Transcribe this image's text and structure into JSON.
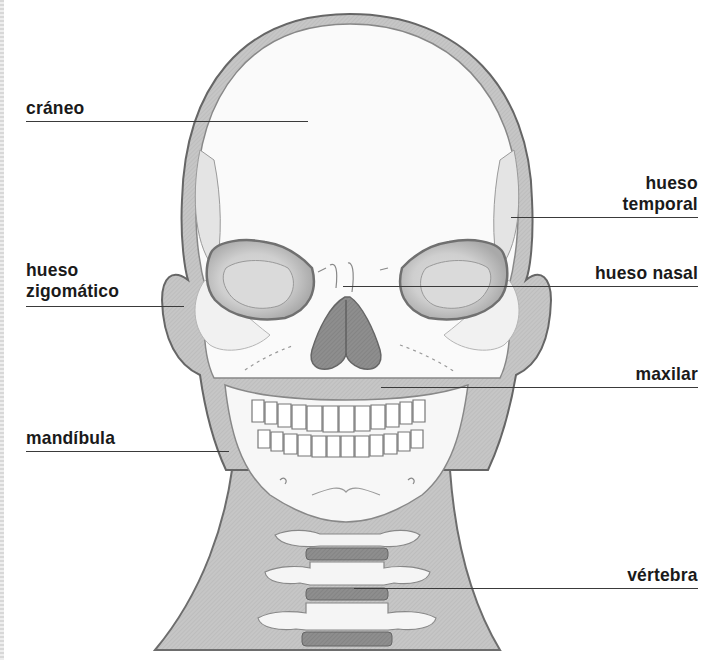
{
  "diagram": {
    "title": "",
    "colors": {
      "background": "#ffffff",
      "bone": "#f4f4f4",
      "tissue": "#c9c9c9",
      "outline": "#6a6a6a",
      "dark_disc": "#6f6f6f",
      "label_text": "#1a1a1a",
      "leader_line": "#3a3a3a"
    },
    "labels": [
      {
        "id": "craneo",
        "lines": [
          "cráneo"
        ],
        "side": "left"
      },
      {
        "id": "hueso-zigomatico",
        "lines": [
          "hueso",
          "zigomático"
        ],
        "side": "left"
      },
      {
        "id": "mandibula",
        "lines": [
          "mandíbula"
        ],
        "side": "left"
      },
      {
        "id": "hueso-temporal",
        "lines": [
          "hueso",
          "temporal"
        ],
        "side": "right"
      },
      {
        "id": "hueso-nasal",
        "lines": [
          "hueso nasal"
        ],
        "side": "right"
      },
      {
        "id": "maxilar",
        "lines": [
          "maxilar"
        ],
        "side": "right"
      },
      {
        "id": "vertebra",
        "lines": [
          "vértebra"
        ],
        "side": "right"
      }
    ]
  }
}
